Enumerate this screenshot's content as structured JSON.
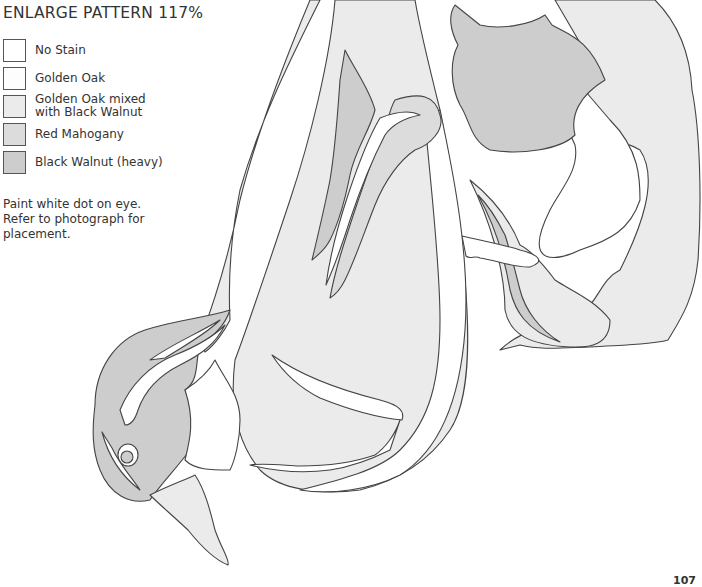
{
  "header": {
    "title": "ENLARGE PATTERN 117%"
  },
  "legend": {
    "items": [
      {
        "label": "No Stain",
        "color": "#ffffff"
      },
      {
        "label": "Golden Oak",
        "color": "#fdfdfd"
      },
      {
        "label": "Golden Oak mixed\nwith Black Walnut",
        "line1": "Golden Oak mixed",
        "line2": "with Black Walnut",
        "color": "#ebebeb"
      },
      {
        "label": "Red Mahogany",
        "color": "#dcdcdc"
      },
      {
        "label": "Black Walnut (heavy)",
        "color": "#cdcdcd"
      }
    ]
  },
  "note": {
    "lines": [
      "Paint white dot on eye.",
      "Refer to photograph for",
      "placement."
    ]
  },
  "page_number": "107",
  "palette": {
    "no_stain": "#ffffff",
    "golden_oak": "#fdfdfd",
    "mixed": "#ebebeb",
    "red_mahogany": "#dcdcdc",
    "black_walnut": "#cdcdcd",
    "outline": "#444444"
  }
}
